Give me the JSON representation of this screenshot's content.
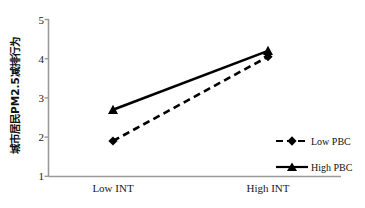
{
  "chart_data": {
    "type": "line",
    "title": "",
    "subtitle": "",
    "xlabel": "",
    "ylabel": "城市居民PM2.5减排行为",
    "categories": [
      "Low INT",
      "High INT"
    ],
    "x": [
      0,
      1
    ],
    "ylim": [
      1,
      5
    ],
    "yticks": [
      "1",
      "2",
      "3",
      "4",
      "5"
    ],
    "ytick_values": [
      1,
      2,
      3,
      4,
      5
    ],
    "grid": false,
    "legend_position": "right",
    "series": [
      {
        "name": "Low PBC",
        "values": [
          1.9,
          4.05
        ],
        "linestyle": "dashed",
        "marker": "diamond",
        "color": "#000000"
      },
      {
        "name": "High PBC",
        "values": [
          2.7,
          4.2
        ],
        "linestyle": "solid",
        "marker": "triangle",
        "color": "#000000"
      }
    ],
    "axis_color": "#808080",
    "text_color": "#111111",
    "background": "#ffffff"
  },
  "legend": {
    "items": [
      {
        "label": "Low PBC",
        "marker": "diamond-marker-icon",
        "line": "dashed"
      },
      {
        "label": "High PBC",
        "marker": "triangle-marker-icon",
        "line": "solid"
      }
    ]
  },
  "axes": {
    "y_label": "城市居民PM2.5减排行为",
    "y_ticks": [
      "5",
      "4",
      "3",
      "2",
      "1"
    ],
    "x_ticks": [
      "Low INT",
      "High INT"
    ]
  }
}
